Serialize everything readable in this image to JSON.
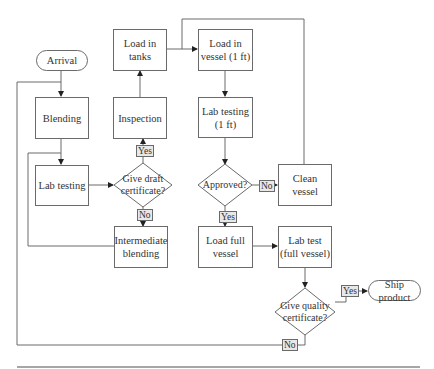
{
  "diagram": {
    "type": "flowchart",
    "nodes": {
      "arrival": "Arrival",
      "blending": "Blending",
      "lab_testing": "Lab testing",
      "inspection": "Inspection",
      "load_in_tanks": "Load in tanks",
      "give_draft_certificate": "Give draft certificate?",
      "intermediate_blending": "Intermediate blending",
      "load_in_vessel": "Load in vessel (1 ft)",
      "lab_testing_1ft": "Lab testing (1 ft)",
      "approved": "Approved?",
      "clean_vessel": "Clean vessel",
      "load_full_vessel": "Load full vessel",
      "lab_test_full_vessel": "Lab test (full vessel)",
      "give_quality_certificate": "Give quality certificate?",
      "ship_product": "Ship product"
    },
    "labels": {
      "draft_yes": "Yes",
      "draft_no": "No",
      "approved_yes": "Yes",
      "approved_no": "No",
      "quality_yes": "Yes",
      "quality_no": "No"
    },
    "edges": [
      {
        "from": "Arrival",
        "to": "Blending"
      },
      {
        "from": "Blending",
        "to": "Lab testing"
      },
      {
        "from": "Lab testing",
        "to": "Give draft certificate?"
      },
      {
        "from": "Give draft certificate?",
        "to": "Inspection",
        "label": "Yes"
      },
      {
        "from": "Give draft certificate?",
        "to": "Intermediate blending",
        "label": "No"
      },
      {
        "from": "Intermediate blending",
        "to": "Lab testing"
      },
      {
        "from": "Inspection",
        "to": "Load in tanks"
      },
      {
        "from": "Load in tanks",
        "to": "Load in vessel (1 ft)"
      },
      {
        "from": "Load in vessel (1 ft)",
        "to": "Lab testing (1 ft)"
      },
      {
        "from": "Lab testing (1 ft)",
        "to": "Approved?"
      },
      {
        "from": "Approved?",
        "to": "Clean vessel",
        "label": "No"
      },
      {
        "from": "Clean vessel",
        "to": "Load in vessel (1 ft)"
      },
      {
        "from": "Approved?",
        "to": "Load full vessel",
        "label": "Yes"
      },
      {
        "from": "Load full vessel",
        "to": "Lab test (full vessel)"
      },
      {
        "from": "Lab test (full vessel)",
        "to": "Give quality certificate?"
      },
      {
        "from": "Give quality certificate?",
        "to": "Ship product",
        "label": "Yes"
      },
      {
        "from": "Give quality certificate?",
        "to": "Blending",
        "label": "No"
      }
    ]
  }
}
